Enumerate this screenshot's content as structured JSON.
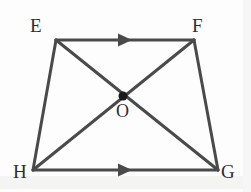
{
  "figure": {
    "width": 251,
    "height": 192,
    "background_color": "#fdfdfd",
    "stroke_color": "#4a4a4a",
    "stroke_width": 3,
    "label_color": "#2e2e2e",
    "dot_color": "#1a1a1a",
    "dot_radius": 4
  },
  "vertices": [
    {
      "id": "E",
      "label": "E",
      "x": 56,
      "y": 40,
      "label_x": 30,
      "label_y": 16
    },
    {
      "id": "F",
      "label": "F",
      "x": 194,
      "y": 40,
      "label_x": 192,
      "label_y": 16
    },
    {
      "id": "G",
      "label": "G",
      "x": 218,
      "y": 170,
      "label_x": 221,
      "label_y": 162
    },
    {
      "id": "H",
      "label": "H",
      "x": 33,
      "y": 170,
      "label_x": 13,
      "label_y": 162
    }
  ],
  "center_point": {
    "id": "O",
    "label": "O",
    "x": 123,
    "y": 96,
    "label_x": 116,
    "label_y": 102
  },
  "edges": [
    {
      "id": "EF",
      "from": "E",
      "to": "F",
      "arrow_marks": 1,
      "note": "top parallel side"
    },
    {
      "id": "FG",
      "from": "F",
      "to": "G",
      "arrow_marks": 0,
      "note": "right leg"
    },
    {
      "id": "HG",
      "from": "H",
      "to": "G",
      "arrow_marks": 1,
      "note": "bottom parallel side"
    },
    {
      "id": "EH",
      "from": "E",
      "to": "H",
      "arrow_marks": 0,
      "note": "left leg"
    }
  ],
  "diagonals": [
    {
      "id": "EG",
      "from": "E",
      "to": "G",
      "note": "diagonal through O"
    },
    {
      "id": "FH",
      "from": "F",
      "to": "H",
      "note": "diagonal through O"
    }
  ],
  "parallel_marks": [
    {
      "id": "mark-EF",
      "on_edge": "EF",
      "x": 125,
      "y": 40,
      "direction": "right"
    },
    {
      "id": "mark-HG",
      "on_edge": "HG",
      "x": 125,
      "y": 170,
      "direction": "right"
    }
  ]
}
